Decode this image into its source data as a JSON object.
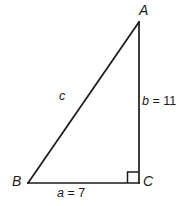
{
  "figure": {
    "type": "right-triangle-diagram",
    "background_color": "#ffffff",
    "stroke_color": "#1a1a1a",
    "vertices": {
      "A": {
        "label": "A",
        "x": 139,
        "y": 22
      },
      "B": {
        "label": "B",
        "x": 28,
        "y": 183
      },
      "C": {
        "label": "C",
        "x": 139,
        "y": 183
      }
    },
    "sides": {
      "a": {
        "variable": "a",
        "equals": " = 7",
        "value": 7,
        "full": "a = 7",
        "between": "B-C"
      },
      "b": {
        "variable": "b",
        "equals": " = 11",
        "value": 11,
        "full": "b = 11",
        "between": "A-C"
      },
      "c": {
        "variable": "c",
        "equals": "",
        "value": null,
        "full": "c",
        "between": "A-B"
      }
    },
    "right_angle": {
      "at": "C",
      "marker": "square",
      "size": 11
    }
  }
}
